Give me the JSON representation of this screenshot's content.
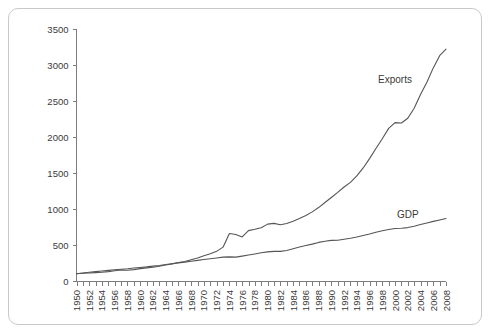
{
  "chart_data": {
    "type": "line",
    "title": "",
    "subtitle": "",
    "xlabel": "",
    "ylabel": "",
    "xlim": [
      1950,
      2008
    ],
    "ylim": [
      0,
      3500
    ],
    "yticks": [
      0,
      500,
      1000,
      1500,
      2000,
      2500,
      3000,
      3500
    ],
    "ytick_labels": [
      "0",
      "500",
      "1000",
      "1500",
      "2000",
      "2500",
      "3000",
      "3500"
    ],
    "grid": false,
    "legend_position": "inline-annotation",
    "x_minor_tick_interval": 1,
    "x_label_interval": 2,
    "x": [
      1950,
      1951,
      1952,
      1953,
      1954,
      1955,
      1956,
      1957,
      1958,
      1959,
      1960,
      1961,
      1962,
      1963,
      1964,
      1965,
      1966,
      1967,
      1968,
      1969,
      1970,
      1971,
      1972,
      1973,
      1974,
      1975,
      1976,
      1977,
      1978,
      1979,
      1980,
      1981,
      1982,
      1983,
      1984,
      1985,
      1986,
      1987,
      1988,
      1989,
      1990,
      1991,
      1992,
      1993,
      1994,
      1995,
      1996,
      1997,
      1998,
      1999,
      2000,
      2001,
      2002,
      2003,
      2004,
      2005,
      2006,
      2007,
      2008
    ],
    "xtick_labels": [
      "1950",
      "1952",
      "1954",
      "1956",
      "1958",
      "1960",
      "1962",
      "1964",
      "1966",
      "1968",
      "1970",
      "1972",
      "1974",
      "1976",
      "1978",
      "1980",
      "1982",
      "1984",
      "1986",
      "1988",
      "1990",
      "1992",
      "1994",
      "1996",
      "1998",
      "2000",
      "2002",
      "2004",
      "2006",
      "2008"
    ],
    "series": [
      {
        "name": "Exports",
        "label": "Exports",
        "color": "#555555",
        "annotation_x": 2000,
        "annotation_y": 2750,
        "values": [
          100,
          108,
          112,
          116,
          122,
          130,
          142,
          152,
          150,
          158,
          172,
          182,
          192,
          205,
          222,
          238,
          256,
          270,
          296,
          320,
          352,
          378,
          412,
          470,
          660,
          645,
          612,
          700,
          718,
          740,
          790,
          800,
          782,
          798,
          830,
          868,
          910,
          960,
          1020,
          1090,
          1160,
          1230,
          1305,
          1370,
          1460,
          1570,
          1700,
          1840,
          1975,
          2120,
          2200,
          2195,
          2260,
          2400,
          2590,
          2760,
          2960,
          3130,
          3220
        ]
      },
      {
        "name": "GDP",
        "label": "GDP",
        "color": "#555555",
        "annotation_x": 2002,
        "annotation_y": 880,
        "values": [
          100,
          112,
          122,
          130,
          138,
          148,
          156,
          164,
          170,
          180,
          188,
          196,
          206,
          216,
          228,
          240,
          252,
          262,
          274,
          286,
          298,
          308,
          320,
          332,
          335,
          332,
          346,
          360,
          376,
          392,
          404,
          412,
          412,
          424,
          448,
          472,
          492,
          512,
          536,
          552,
          564,
          566,
          580,
          594,
          612,
          632,
          652,
          676,
          698,
          716,
          730,
          732,
          742,
          760,
          784,
          806,
          828,
          848,
          868
        ]
      }
    ]
  },
  "axes": {
    "y_axis_name": "value-axis",
    "x_axis_name": "year-axis"
  }
}
